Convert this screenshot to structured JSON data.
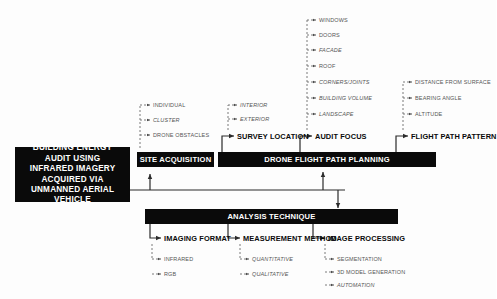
{
  "diagram": {
    "type": "flowchart",
    "root": {
      "label": "BUILDING ENERGY AUDIT USING INFRARED IMAGERY ACQUIRED VIA UNMANNED AERIAL VEHICLE",
      "lines": [
        "BUILDING ENERGY",
        "AUDIT USING",
        "INFRARED IMAGERY",
        "ACQUIRED VIA",
        "UNMANNED AERIAL",
        "VEHICLE"
      ]
    },
    "bars": {
      "site_acquisition": "SITE ACQUISITION",
      "drone_flight_path_planning": "DRONE FLIGHT PATH PLANNING",
      "analysis_technique": "ANALYSIS TECHNIQUE"
    },
    "branches": {
      "site_acquisition_items": [
        "INDIVIDUAL",
        "CLUSTER",
        "DRONE OBSTACLES"
      ],
      "survey_location": {
        "label": "SURVEY LOCATION",
        "items": [
          "INTERIOR",
          "EXTERIOR"
        ]
      },
      "audit_focus": {
        "label": "AUDIT FOCUS",
        "items": [
          "WINDOWS",
          "DOORS",
          "FACADE",
          "ROOF",
          "CORNERS/JOINTS",
          "BUILDING VOLUME",
          "LANDSCAPE"
        ]
      },
      "flight_path_pattern": {
        "label": "FLIGHT PATH PATTERN",
        "items": [
          "DISTANCE FROM SURFACE",
          "BEARING ANGLE",
          "ALTITUDE"
        ]
      },
      "imaging_format": {
        "label": "IMAGING FORMAT",
        "items": [
          "INFRARED",
          "RGB"
        ]
      },
      "measurement_method": {
        "label": "MEASUREMENT METHOD",
        "items": [
          "QUANTITATIVE",
          "QUALITATIVE"
        ]
      },
      "image_processing": {
        "label": "IMAGE PROCESSING",
        "items": [
          "SEGMENTATION",
          "3D MODEL GENERATION",
          "AUTOMATION"
        ]
      }
    },
    "colors": {
      "bar_fill": "#0a0a0a",
      "bar_text": "#ffffff",
      "caption_text": "#0a0a0a",
      "leaf_text": "#555555",
      "connector": "#2b2b2b",
      "background": "#fdfdfd"
    }
  }
}
